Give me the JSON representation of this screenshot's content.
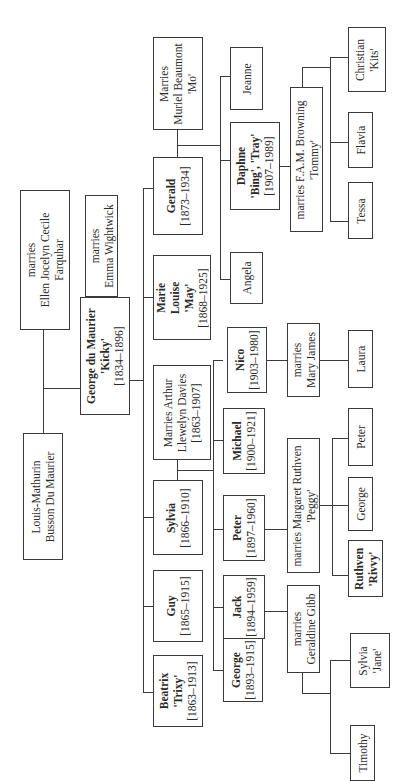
{
  "orientation": "rotated 90 degrees counter-clockwise",
  "people": {
    "louis": {
      "lines": [
        "Louis-Mathurin",
        "Busson Du Maurier"
      ]
    },
    "ellen": {
      "lines": [
        "marries",
        "Ellen Jocelyn Cecile",
        "Farquhar"
      ]
    },
    "emma": {
      "lines": [
        "marries",
        "Emma Wightwick"
      ]
    },
    "george_dm": {
      "lines": [
        "George du Maurier",
        "'Kicky'",
        "[1834–1896]"
      ],
      "bold_lines": [
        0
      ]
    },
    "beatrix": {
      "lines": [
        "Beatrix",
        "'Trixy'",
        "[1863–1913]"
      ],
      "bold_lines": [
        0,
        1
      ]
    },
    "guy": {
      "lines": [
        "Guy",
        "[1865–1915]"
      ],
      "bold_lines": [
        0
      ]
    },
    "sylvia": {
      "lines": [
        "Sylvia",
        "[1866–1910]"
      ],
      "bold_lines": [
        0
      ]
    },
    "arthur": {
      "lines": [
        "Marries Arthur",
        "Llewelyn Davies",
        "[1863–1907]"
      ]
    },
    "marie": {
      "lines": [
        "Marie",
        "Louise",
        "'May'",
        "[1868–1925]"
      ],
      "bold_lines": [
        0,
        1,
        2
      ]
    },
    "gerald": {
      "lines": [
        "Gerald",
        "[1873–1934]"
      ],
      "bold_lines": [
        0
      ]
    },
    "muriel": {
      "lines": [
        "Marries",
        "Muriel Beaumont",
        "'Mo'"
      ]
    },
    "george_ld": {
      "lines": [
        "George",
        "[1893–1915]"
      ],
      "bold_lines": [
        0
      ]
    },
    "jack": {
      "lines": [
        "Jack",
        "[1894–1959]"
      ],
      "bold_lines": [
        0
      ]
    },
    "peter_ld": {
      "lines": [
        "Peter",
        "[1897–1960]"
      ],
      "bold_lines": [
        0
      ]
    },
    "michael": {
      "lines": [
        "Michael",
        "[1900–1921]"
      ],
      "bold_lines": [
        0
      ]
    },
    "nico": {
      "lines": [
        "Nico",
        "[1903–1980]"
      ],
      "bold_lines": [
        0
      ]
    },
    "angela": {
      "lines": [
        "Angela"
      ]
    },
    "daphne": {
      "lines": [
        "Daphne",
        "'Bing', 'Tray'",
        "[1907–1989]"
      ],
      "bold_lines": [
        0,
        1
      ]
    },
    "jeanne": {
      "lines": [
        "Jeanne"
      ]
    },
    "geraldine": {
      "lines": [
        "marries",
        "Geraldine Gibb"
      ]
    },
    "margaret": {
      "lines": [
        "marries Margaret Ruthven",
        "'Peggy'"
      ]
    },
    "mary": {
      "lines": [
        "marries",
        "Mary James"
      ]
    },
    "browning": {
      "lines": [
        "marries F.A.M. Browning",
        "'Tommy'"
      ]
    },
    "timothy": {
      "lines": [
        "Timothy"
      ]
    },
    "sylvia_jane": {
      "lines": [
        "Sylvia",
        "'Jane'"
      ]
    },
    "ruthven": {
      "lines": [
        "Ruthven",
        "'Rivvy'"
      ],
      "bold_lines": [
        0,
        1
      ]
    },
    "george_r": {
      "lines": [
        "George"
      ]
    },
    "peter_r": {
      "lines": [
        "Peter"
      ]
    },
    "laura": {
      "lines": [
        "Laura"
      ]
    },
    "tessa": {
      "lines": [
        "Tessa"
      ]
    },
    "flavia": {
      "lines": [
        "Flavia"
      ]
    },
    "christian": {
      "lines": [
        "Christian",
        "'Kits'"
      ]
    }
  }
}
